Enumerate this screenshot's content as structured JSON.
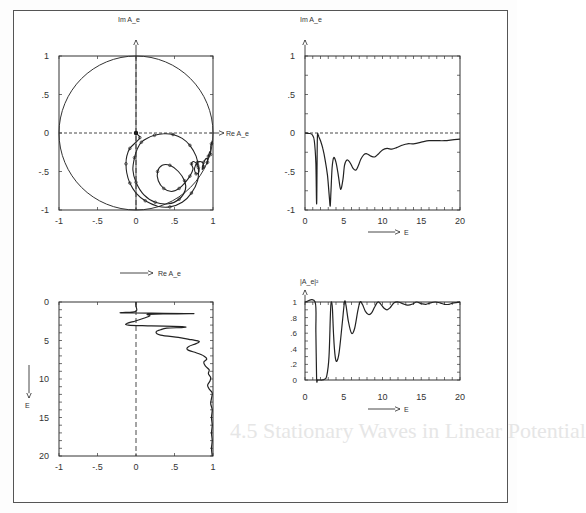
{
  "figure": {
    "background_heading": "4.5 Stationary Waves in Linear Potential",
    "panels": {
      "argand": {
        "ylabel": "Im A_e",
        "xlabel": "Re A_e"
      },
      "imag": {
        "ylabel": "Im A_e",
        "xlabel": "E"
      },
      "real": {
        "xlabel": "Re A_e",
        "ylabel": "E"
      },
      "prob": {
        "ylabel": "|A_e|²",
        "xlabel": "E"
      }
    }
  },
  "chart_data": [
    {
      "id": "argand",
      "type": "line",
      "title": "",
      "xlabel": "Re A_e",
      "ylabel": "Im A_e",
      "xlim": [
        -1,
        1
      ],
      "ylim": [
        -1,
        1
      ],
      "xticks": [
        "-1",
        "-.5",
        "0",
        ".5",
        "1"
      ],
      "yticks": [
        "-1",
        "-.5",
        "0",
        ".5",
        "1"
      ],
      "annotations": [
        "unit circle",
        "dashed axes through origin",
        "dots mark equal E steps"
      ],
      "series": [
        {
          "name": "unit circle",
          "kind": "circle",
          "cx": 0,
          "cy": 0,
          "r": 1
        },
        {
          "name": "A_e(E)",
          "kind": "curve",
          "points": [
            [
              0,
              0
            ],
            [
              0.02,
              -0.02
            ],
            [
              0.05,
              -0.06
            ],
            [
              0.0,
              -0.12
            ],
            [
              -0.08,
              -0.2
            ],
            [
              -0.12,
              -0.3
            ],
            [
              -0.13,
              -0.4
            ],
            [
              -0.12,
              -0.52
            ],
            [
              -0.08,
              -0.65
            ],
            [
              0.0,
              -0.78
            ],
            [
              0.12,
              -0.88
            ],
            [
              0.28,
              -0.95
            ],
            [
              0.44,
              -0.96
            ],
            [
              0.6,
              -0.9
            ],
            [
              0.72,
              -0.78
            ],
            [
              0.8,
              -0.62
            ],
            [
              0.81,
              -0.45
            ],
            [
              0.78,
              -0.3
            ],
            [
              0.7,
              -0.16
            ],
            [
              0.6,
              -0.07
            ],
            [
              0.48,
              -0.02
            ],
            [
              0.36,
              -0.01
            ],
            [
              0.24,
              -0.03
            ],
            [
              0.14,
              -0.07
            ],
            [
              0.07,
              -0.12
            ],
            [
              0.02,
              -0.2
            ],
            [
              -0.02,
              -0.32
            ],
            [
              -0.04,
              -0.48
            ],
            [
              0.0,
              -0.64
            ],
            [
              0.1,
              -0.8
            ],
            [
              0.25,
              -0.9
            ],
            [
              0.42,
              -0.92
            ],
            [
              0.56,
              -0.86
            ],
            [
              0.64,
              -0.74
            ],
            [
              0.63,
              -0.62
            ],
            [
              0.55,
              -0.5
            ],
            [
              0.44,
              -0.42
            ],
            [
              0.34,
              -0.42
            ],
            [
              0.28,
              -0.5
            ],
            [
              0.29,
              -0.62
            ],
            [
              0.36,
              -0.72
            ],
            [
              0.46,
              -0.76
            ],
            [
              0.56,
              -0.72
            ],
            [
              0.64,
              -0.64
            ],
            [
              0.7,
              -0.56
            ],
            [
              0.74,
              -0.47
            ],
            [
              0.72,
              -0.4
            ],
            [
              0.75,
              -0.37
            ],
            [
              0.8,
              -0.42
            ],
            [
              0.82,
              -0.5
            ],
            [
              0.78,
              -0.53
            ],
            [
              0.76,
              -0.46
            ],
            [
              0.8,
              -0.38
            ],
            [
              0.86,
              -0.38
            ],
            [
              0.88,
              -0.44
            ],
            [
              0.86,
              -0.47
            ],
            [
              0.88,
              -0.38
            ],
            [
              0.92,
              -0.33
            ],
            [
              0.93,
              -0.38
            ],
            [
              0.92,
              -0.4
            ],
            [
              0.94,
              -0.3
            ],
            [
              0.96,
              -0.24
            ],
            [
              0.97,
              -0.28
            ],
            [
              0.97,
              -0.18
            ],
            [
              0.98,
              -0.14
            ],
            [
              0.99,
              -0.1
            ]
          ]
        }
      ]
    },
    {
      "id": "imag",
      "type": "line",
      "title": "",
      "xlabel": "E",
      "ylabel": "Im A_e",
      "xlim": [
        0,
        20
      ],
      "ylim": [
        -1,
        1
      ],
      "xticks": [
        "0",
        "5",
        "10",
        "15",
        "20"
      ],
      "yticks": [
        "-1",
        "-.5",
        "0",
        ".5",
        "1"
      ],
      "annotations": [
        "dashed line at 0"
      ],
      "series": [
        {
          "name": "Im A_e",
          "x": [
            0,
            0.5,
            0.9,
            1.2,
            1.4,
            1.5,
            1.55,
            1.6,
            1.7,
            1.8,
            2.0,
            2.3,
            2.6,
            2.9,
            3.1,
            3.25,
            3.35,
            3.5,
            3.7,
            4.0,
            4.3,
            4.6,
            4.9,
            5.1,
            5.4,
            5.8,
            6.2,
            6.6,
            6.9,
            7.2,
            7.6,
            8.0,
            8.5,
            9.0,
            9.5,
            10.0,
            10.6,
            11.2,
            11.8,
            12.5,
            13.2,
            14,
            15,
            16,
            17,
            18,
            19,
            20
          ],
          "values": [
            0,
            -0.005,
            -0.02,
            -0.1,
            -0.4,
            -0.92,
            -0.5,
            -0.05,
            -0.02,
            -0.05,
            -0.1,
            -0.2,
            -0.35,
            -0.55,
            -0.78,
            -0.95,
            -0.75,
            -0.45,
            -0.32,
            -0.38,
            -0.55,
            -0.73,
            -0.6,
            -0.42,
            -0.35,
            -0.38,
            -0.46,
            -0.48,
            -0.42,
            -0.34,
            -0.28,
            -0.27,
            -0.3,
            -0.31,
            -0.27,
            -0.22,
            -0.2,
            -0.21,
            -0.19,
            -0.16,
            -0.14,
            -0.14,
            -0.12,
            -0.1,
            -0.1,
            -0.1,
            -0.09,
            -0.08
          ]
        }
      ]
    },
    {
      "id": "real",
      "type": "line",
      "title": "",
      "xlabel": "Re A_e",
      "ylabel": "E",
      "orientation": "vertical (E increases downward)",
      "xlim": [
        -1,
        1
      ],
      "ylim": [
        0,
        20
      ],
      "xticks": [
        "-1",
        "-.5",
        "0",
        ".5",
        "1"
      ],
      "yticks": [
        "0",
        "5",
        "10",
        "15",
        "20"
      ],
      "annotations": [
        "dashed line at Re A_e = 0"
      ],
      "series": [
        {
          "name": "Re A_e",
          "E": [
            0,
            0.5,
            1.0,
            1.2,
            1.3,
            1.4,
            1.45,
            1.5,
            1.55,
            1.6,
            1.8,
            2.1,
            2.5,
            2.8,
            3.0,
            3.1,
            3.2,
            3.3,
            3.4,
            3.6,
            3.9,
            4.3,
            4.6,
            4.9,
            5.1,
            5.4,
            5.8,
            6.2,
            6.6,
            7.0,
            7.4,
            7.8,
            8.3,
            8.8,
            9.3,
            9.8,
            10.3,
            10.8,
            11.3,
            11.8,
            12.5,
            13.2,
            14,
            15,
            16,
            17,
            18,
            19,
            20
          ],
          "values": [
            0,
            0,
            0.01,
            0.0,
            -0.05,
            -0.2,
            0.2,
            0.75,
            0.35,
            0.15,
            0.18,
            0.1,
            -0.02,
            -0.12,
            -0.1,
            0.2,
            0.6,
            0.62,
            0.4,
            0.32,
            0.26,
            0.32,
            0.55,
            0.72,
            0.82,
            0.78,
            0.68,
            0.67,
            0.78,
            0.88,
            0.92,
            0.88,
            0.9,
            0.95,
            0.94,
            0.97,
            0.96,
            0.93,
            0.95,
            0.99,
            0.98,
            0.97,
            0.99,
            0.98,
            0.99,
            0.98,
            0.99,
            0.98,
            0.99
          ]
        }
      ]
    },
    {
      "id": "prob",
      "type": "line",
      "title": "",
      "xlabel": "E",
      "ylabel": "|A_e|²",
      "xlim": [
        0,
        20
      ],
      "ylim": [
        0,
        1
      ],
      "xticks": [
        "0",
        "5",
        "10",
        "15",
        "20"
      ],
      "yticks": [
        "0",
        ".2",
        ".4",
        ".6",
        ".8",
        "1"
      ],
      "annotations": [],
      "series": [
        {
          "name": "|A_e|^2",
          "x": [
            0,
            1.3,
            1.4,
            1.5,
            1.6,
            1.7,
            1.9,
            2.2,
            2.5,
            2.8,
            3.1,
            3.3,
            3.45,
            3.55,
            3.7,
            3.9,
            4.1,
            4.4,
            4.8,
            5.1,
            5.3,
            5.6,
            6.0,
            6.4,
            6.8,
            7.1,
            7.4,
            7.8,
            8.2,
            8.6,
            9.0,
            9.4,
            9.8,
            10.2,
            10.6,
            11.0,
            11.5,
            12.0,
            12.6,
            13.2,
            13.8,
            14.4,
            15.0,
            15.6,
            16.2,
            16.8,
            17.4,
            18,
            18.6,
            19.2,
            20
          ],
          "values": [
            1,
            1,
            0.6,
            0.02,
            0.0,
            0.0,
            0.0,
            0.0,
            0.01,
            0.05,
            0.3,
            0.9,
            1.0,
            0.9,
            0.55,
            0.3,
            0.24,
            0.35,
            0.72,
            1.0,
            0.95,
            0.75,
            0.6,
            0.66,
            0.88,
            1.0,
            0.97,
            0.88,
            0.84,
            0.86,
            0.94,
            1.0,
            0.97,
            0.92,
            0.9,
            0.93,
            0.99,
            1.0,
            0.98,
            0.96,
            0.97,
            1.0,
            0.98,
            0.97,
            0.99,
            1.0,
            0.99,
            0.97,
            0.97,
            0.99,
            1.0
          ]
        }
      ]
    }
  ]
}
